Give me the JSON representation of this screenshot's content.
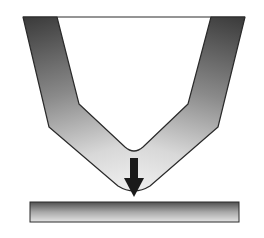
{
  "diagram": {
    "title": "",
    "elements": [
      {
        "id": "v-tip",
        "type": "shape",
        "label": ""
      },
      {
        "id": "force-arrow",
        "type": "arrow",
        "direction": "down",
        "label": ""
      },
      {
        "id": "flat-plate",
        "type": "shape",
        "label": ""
      }
    ],
    "colors": {
      "tip_dark": "#3c3c3c",
      "tip_light": "#e6e6e6",
      "plate_dark": "#5a5a5a",
      "plate_light": "#e2e2e2",
      "outline": "#2a2a2a",
      "arrow": "#1a1a1a"
    }
  }
}
